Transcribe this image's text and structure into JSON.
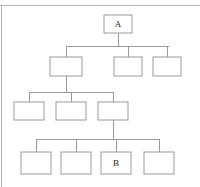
{
  "figure": {
    "type": "hierarchy-tree-diagram",
    "title": "",
    "background_color": "#ffffff",
    "box_stroke_color": "#9a9a9a",
    "connector_color": "#9a9a9a",
    "rule_color": "#b4b4b4",
    "label_color": "#1a1a1a"
  },
  "top_rule": {
    "name": "top-horizontal-rule",
    "x1": 0,
    "y1": 5,
    "x2": 200,
    "y2": 5
  },
  "left_rule": {
    "name": "left-vertical-rule",
    "x1": 1,
    "y1": 5,
    "x2": 1,
    "y2": 187
  },
  "levels": [
    {
      "level": 1,
      "nodes": [
        {
          "id": "n1",
          "label": "A",
          "x": 104,
          "y": 15,
          "w": 28,
          "h": 18
        }
      ]
    },
    {
      "level": 2,
      "nodes": [
        {
          "id": "n2",
          "label": "",
          "x": 50,
          "y": 57,
          "w": 32,
          "h": 19
        },
        {
          "id": "n3",
          "label": "",
          "x": 114,
          "y": 57,
          "w": 28,
          "h": 19
        },
        {
          "id": "n4",
          "label": "",
          "x": 153,
          "y": 57,
          "w": 28,
          "h": 19
        }
      ]
    },
    {
      "level": 3,
      "nodes": [
        {
          "id": "n5",
          "label": "",
          "x": 14,
          "y": 102,
          "w": 30,
          "h": 18
        },
        {
          "id": "n6",
          "label": "",
          "x": 56,
          "y": 102,
          "w": 30,
          "h": 18
        },
        {
          "id": "n7",
          "label": "",
          "x": 98,
          "y": 102,
          "w": 30,
          "h": 18
        }
      ]
    },
    {
      "level": 4,
      "nodes": [
        {
          "id": "n8",
          "label": "",
          "x": 21,
          "y": 152,
          "w": 30,
          "h": 22
        },
        {
          "id": "n9",
          "label": "",
          "x": 61,
          "y": 152,
          "w": 30,
          "h": 22
        },
        {
          "id": "n10",
          "label": "B",
          "x": 101,
          "y": 152,
          "w": 30,
          "h": 22
        },
        {
          "id": "n11",
          "label": "",
          "x": 144,
          "y": 152,
          "w": 30,
          "h": 22
        }
      ]
    }
  ],
  "connectors": [
    {
      "name": "edge-a-to-bus2",
      "points": "118,33 118,46"
    },
    {
      "name": "bus-level2",
      "points": "66,46 169,46"
    },
    {
      "name": "edge-bus2-to-n2",
      "points": "66,46 66,57"
    },
    {
      "name": "edge-bus2-to-n3",
      "points": "128,46 128,57"
    },
    {
      "name": "edge-bus2-to-n4",
      "points": "167,46 167,57"
    },
    {
      "name": "edge-n2-to-bus3",
      "points": "66,76 66,92"
    },
    {
      "name": "bus-level3",
      "points": "29,92 113,92"
    },
    {
      "name": "edge-bus3-to-n5",
      "points": "29,92 29,102"
    },
    {
      "name": "edge-bus3-to-n6",
      "points": "71,92 71,102"
    },
    {
      "name": "edge-bus3-to-n7",
      "points": "113,92 113,102"
    },
    {
      "name": "edge-n7-to-bus4",
      "points": "113,120 113,139"
    },
    {
      "name": "bus-level4",
      "points": "36,139 159,139"
    },
    {
      "name": "edge-bus4-to-n8",
      "points": "36,139 36,152"
    },
    {
      "name": "edge-bus4-to-n9",
      "points": "76,139 76,152"
    },
    {
      "name": "edge-bus4-to-n10",
      "points": "116,139 116,152"
    },
    {
      "name": "edge-bus4-to-n11",
      "points": "159,139 159,152"
    }
  ],
  "chart_data": {
    "type": "diagram",
    "diagram_type": "tree",
    "title": "",
    "node_count": 11,
    "depth": 4,
    "labeled_nodes": [
      {
        "id": "n1",
        "label": "A",
        "level": 1
      },
      {
        "id": "n10",
        "label": "B",
        "level": 4
      }
    ],
    "edges": [
      {
        "from": "n1",
        "to": "n2"
      },
      {
        "from": "n1",
        "to": "n3"
      },
      {
        "from": "n1",
        "to": "n4"
      },
      {
        "from": "n2",
        "to": "n5"
      },
      {
        "from": "n2",
        "to": "n6"
      },
      {
        "from": "n2",
        "to": "n7"
      },
      {
        "from": "n7",
        "to": "n8"
      },
      {
        "from": "n7",
        "to": "n9"
      },
      {
        "from": "n7",
        "to": "n10"
      },
      {
        "from": "n7",
        "to": "n11"
      }
    ],
    "children_per_level": [
      1,
      3,
      3,
      4
    ]
  }
}
